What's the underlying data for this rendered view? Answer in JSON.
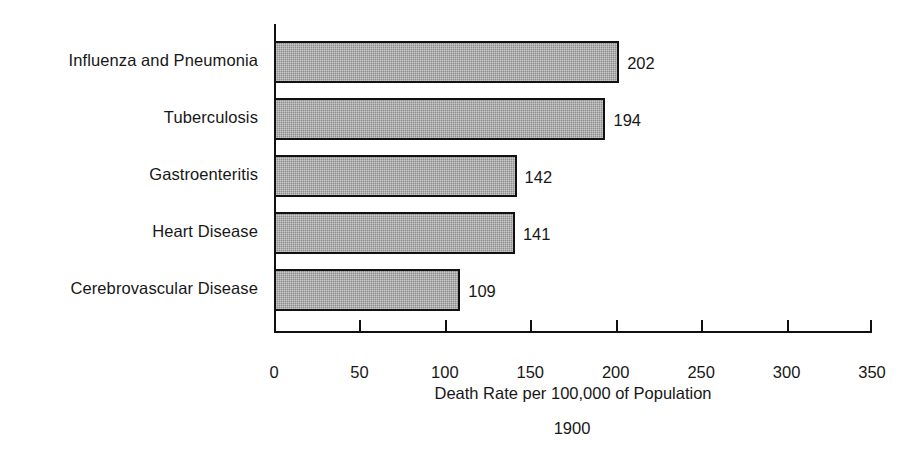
{
  "chart_data": {
    "type": "bar",
    "orientation": "horizontal",
    "title": "",
    "subtitle": "",
    "xlabel": "Death Rate per 100,000 of Population",
    "ylabel": "",
    "caption": "1900",
    "categories": [
      "Influenza and Pneumonia",
      "Tuberculosis",
      "Gastroenteritis",
      "Heart Disease",
      "Cerebrovascular Disease"
    ],
    "values": [
      202,
      194,
      142,
      141,
      109
    ],
    "value_labels": [
      "202",
      "194",
      "142",
      "141",
      "109"
    ],
    "xlim": [
      0,
      350
    ],
    "xticks": [
      0,
      50,
      100,
      150,
      200,
      250,
      300,
      350
    ],
    "xtick_labels": [
      "0",
      "50",
      "100",
      "150",
      "200",
      "250",
      "300",
      "350"
    ],
    "grid": false,
    "legend": false,
    "bar_fill_color": "#8d8d8d",
    "bar_edge_color": "#111111",
    "axis_color": "#111111",
    "text_color": "#171717",
    "background_color": "#ffffff"
  }
}
